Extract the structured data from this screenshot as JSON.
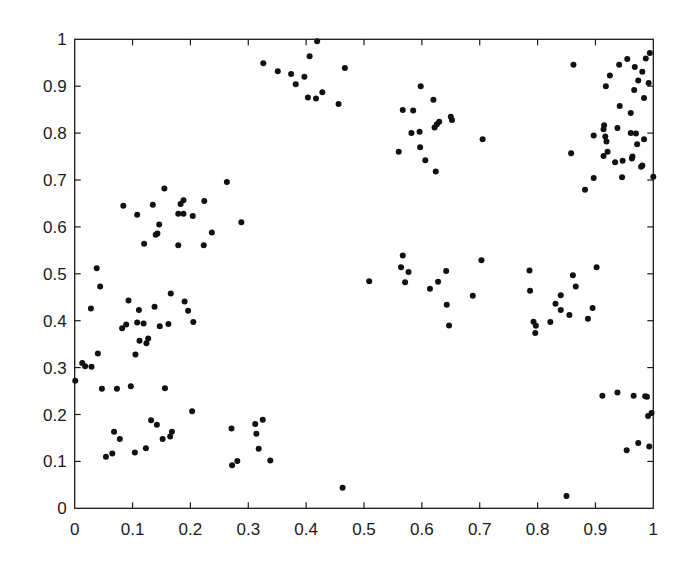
{
  "chart_data": {
    "type": "scatter",
    "title": "",
    "xlabel": "",
    "ylabel": "",
    "xlim": [
      0,
      1
    ],
    "ylim": [
      0,
      1
    ],
    "grid": false,
    "legend": null,
    "x_ticks": [
      "0",
      "0.1",
      "0.2",
      "0.3",
      "0.4",
      "0.5",
      "0.6",
      "0.7",
      "0.8",
      "0.9",
      "1"
    ],
    "y_ticks": [
      "0",
      "0.1",
      "0.2",
      "0.3",
      "0.4",
      "0.5",
      "0.6",
      "0.7",
      "0.8",
      "0.9",
      "1"
    ],
    "marker": {
      "shape": "circle",
      "color": "#111111",
      "size": 3
    },
    "series": [
      {
        "name": "points",
        "points": [
          [
            0.084,
            0.645
          ],
          [
            0.108,
            0.626
          ],
          [
            0.12,
            0.564
          ],
          [
            0.135,
            0.647
          ],
          [
            0.155,
            0.682
          ],
          [
            0.146,
            0.605
          ],
          [
            0.143,
            0.586
          ],
          [
            0.14,
            0.583
          ],
          [
            0.179,
            0.628
          ],
          [
            0.188,
            0.628
          ],
          [
            0.183,
            0.649
          ],
          [
            0.188,
            0.657
          ],
          [
            0.179,
            0.561
          ],
          [
            0.204,
            0.623
          ],
          [
            0.224,
            0.655
          ],
          [
            0.237,
            0.588
          ],
          [
            0.223,
            0.561
          ],
          [
            0.263,
            0.696
          ],
          [
            0.288,
            0.61
          ],
          [
            0.038,
            0.512
          ],
          [
            0.044,
            0.473
          ],
          [
            0.028,
            0.426
          ],
          [
            0.093,
            0.443
          ],
          [
            0.111,
            0.423
          ],
          [
            0.138,
            0.43
          ],
          [
            0.166,
            0.458
          ],
          [
            0.19,
            0.441
          ],
          [
            0.196,
            0.421
          ],
          [
            0.205,
            0.397
          ],
          [
            0.082,
            0.384
          ],
          [
            0.089,
            0.392
          ],
          [
            0.108,
            0.396
          ],
          [
            0.119,
            0.394
          ],
          [
            0.147,
            0.388
          ],
          [
            0.162,
            0.393
          ],
          [
            0.112,
            0.357
          ],
          [
            0.127,
            0.362
          ],
          [
            0.124,
            0.352
          ],
          [
            0.105,
            0.328
          ],
          [
            0.04,
            0.33
          ],
          [
            0.013,
            0.31
          ],
          [
            0.018,
            0.303
          ],
          [
            0.029,
            0.302
          ],
          [
            0.001,
            0.272
          ],
          [
            0.047,
            0.255
          ],
          [
            0.073,
            0.255
          ],
          [
            0.097,
            0.26
          ],
          [
            0.156,
            0.256
          ],
          [
            0.203,
            0.207
          ],
          [
            0.054,
            0.11
          ],
          [
            0.065,
            0.117
          ],
          [
            0.068,
            0.163
          ],
          [
            0.078,
            0.148
          ],
          [
            0.104,
            0.119
          ],
          [
            0.123,
            0.128
          ],
          [
            0.132,
            0.188
          ],
          [
            0.142,
            0.178
          ],
          [
            0.152,
            0.148
          ],
          [
            0.165,
            0.153
          ],
          [
            0.168,
            0.163
          ],
          [
            0.271,
            0.17
          ],
          [
            0.272,
            0.092
          ],
          [
            0.281,
            0.101
          ],
          [
            0.312,
            0.18
          ],
          [
            0.325,
            0.189
          ],
          [
            0.314,
            0.159
          ],
          [
            0.318,
            0.127
          ],
          [
            0.338,
            0.102
          ],
          [
            0.419,
            0.996
          ],
          [
            0.406,
            0.964
          ],
          [
            0.326,
            0.949
          ],
          [
            0.351,
            0.932
          ],
          [
            0.374,
            0.926
          ],
          [
            0.397,
            0.92
          ],
          [
            0.382,
            0.904
          ],
          [
            0.403,
            0.876
          ],
          [
            0.417,
            0.874
          ],
          [
            0.428,
            0.887
          ],
          [
            0.456,
            0.862
          ],
          [
            0.467,
            0.939
          ],
          [
            0.598,
            0.9
          ],
          [
            0.62,
            0.871
          ],
          [
            0.567,
            0.849
          ],
          [
            0.585,
            0.848
          ],
          [
            0.65,
            0.835
          ],
          [
            0.652,
            0.828
          ],
          [
            0.63,
            0.824
          ],
          [
            0.626,
            0.819
          ],
          [
            0.622,
            0.812
          ],
          [
            0.582,
            0.8
          ],
          [
            0.596,
            0.803
          ],
          [
            0.597,
            0.77
          ],
          [
            0.56,
            0.76
          ],
          [
            0.606,
            0.742
          ],
          [
            0.624,
            0.718
          ],
          [
            0.705,
            0.787
          ],
          [
            0.862,
            0.946
          ],
          [
            0.994,
            0.971
          ],
          [
            0.987,
            0.959
          ],
          [
            0.955,
            0.958
          ],
          [
            0.941,
            0.946
          ],
          [
            0.968,
            0.941
          ],
          [
            0.981,
            0.931
          ],
          [
            0.925,
            0.923
          ],
          [
            0.974,
            0.912
          ],
          [
            0.992,
            0.907
          ],
          [
            0.918,
            0.9
          ],
          [
            0.967,
            0.892
          ],
          [
            0.984,
            0.875
          ],
          [
            0.942,
            0.858
          ],
          [
            0.961,
            0.843
          ],
          [
            0.915,
            0.817
          ],
          [
            0.914,
            0.808
          ],
          [
            0.938,
            0.811
          ],
          [
            0.897,
            0.795
          ],
          [
            0.917,
            0.793
          ],
          [
            0.961,
            0.8
          ],
          [
            0.97,
            0.799
          ],
          [
            0.919,
            0.782
          ],
          [
            0.984,
            0.787
          ],
          [
            0.972,
            0.776
          ],
          [
            0.858,
            0.757
          ],
          [
            0.921,
            0.76
          ],
          [
            0.914,
            0.751
          ],
          [
            0.964,
            0.75
          ],
          [
            0.963,
            0.746
          ],
          [
            0.934,
            0.738
          ],
          [
            0.947,
            0.741
          ],
          [
            0.981,
            0.731
          ],
          [
            0.979,
            0.728
          ],
          [
            0.897,
            0.704
          ],
          [
            0.946,
            0.706
          ],
          [
            1.0,
            0.707
          ],
          [
            0.882,
            0.679
          ],
          [
            0.509,
            0.484
          ],
          [
            0.567,
            0.539
          ],
          [
            0.564,
            0.514
          ],
          [
            0.577,
            0.504
          ],
          [
            0.571,
            0.482
          ],
          [
            0.642,
            0.506
          ],
          [
            0.628,
            0.483
          ],
          [
            0.614,
            0.468
          ],
          [
            0.643,
            0.434
          ],
          [
            0.688,
            0.453
          ],
          [
            0.703,
            0.529
          ],
          [
            0.647,
            0.39
          ],
          [
            0.786,
            0.507
          ],
          [
            0.787,
            0.464
          ],
          [
            0.902,
            0.514
          ],
          [
            0.861,
            0.497
          ],
          [
            0.866,
            0.473
          ],
          [
            0.84,
            0.454
          ],
          [
            0.831,
            0.436
          ],
          [
            0.84,
            0.423
          ],
          [
            0.855,
            0.412
          ],
          [
            0.822,
            0.397
          ],
          [
            0.895,
            0.427
          ],
          [
            0.887,
            0.404
          ],
          [
            0.793,
            0.398
          ],
          [
            0.797,
            0.389
          ],
          [
            0.796,
            0.374
          ],
          [
            0.912,
            0.24
          ],
          [
            0.938,
            0.247
          ],
          [
            0.966,
            0.24
          ],
          [
            0.986,
            0.239
          ],
          [
            0.989,
            0.238
          ],
          [
            0.991,
            0.197
          ],
          [
            0.997,
            0.203
          ],
          [
            0.954,
            0.124
          ],
          [
            0.974,
            0.139
          ],
          [
            0.993,
            0.132
          ],
          [
            0.463,
            0.044
          ],
          [
            0.85,
            0.026
          ]
        ]
      }
    ]
  }
}
